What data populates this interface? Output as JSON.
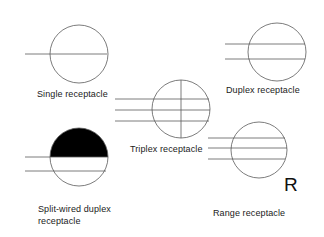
{
  "diagram": {
    "colors": {
      "stroke": "#555555",
      "fill": "#000000",
      "text": "#1a1a1a",
      "background": "#ffffff"
    },
    "symbols": [
      {
        "id": "single",
        "label": "Single receptacle",
        "lines": 1
      },
      {
        "id": "duplex",
        "label": "Duplex receptacle",
        "lines": 2
      },
      {
        "id": "triplex",
        "label": "Triplex receptacle",
        "lines": 3,
        "vertical_divider": true
      },
      {
        "id": "split-wired-duplex",
        "label_line1": "Split-wired duplex",
        "label_line2": "receptacle",
        "lines": 2,
        "filled_top_half": true
      },
      {
        "id": "range",
        "label": "Range receptacle",
        "lines": 3,
        "marker": "R"
      }
    ]
  }
}
